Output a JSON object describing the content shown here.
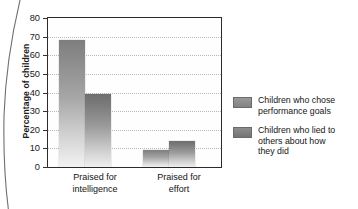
{
  "chart_data": {
    "type": "bar",
    "title": "",
    "xlabel": "",
    "ylabel": "Percentage of children",
    "ylim": [
      0,
      80
    ],
    "ytick_step": 10,
    "yticks": [
      80,
      70,
      60,
      50,
      40,
      30,
      20,
      10,
      0
    ],
    "grid": "horizontal-dotted",
    "legend_position": "right",
    "categories": [
      "Praised for intelligence",
      "Praised for effort"
    ],
    "category_lines": [
      [
        "Praised for",
        "intelligence"
      ],
      [
        "Praised for",
        "effort"
      ]
    ],
    "series": [
      {
        "name": "Children who chose performance goals",
        "name_lines": [
          "Children who chose",
          "performance goals"
        ],
        "color": "#8a8a8a",
        "values": [
          68,
          9
        ]
      },
      {
        "name": "Children who lied to others about how they did",
        "name_lines": [
          "Children who lied to",
          "others about how",
          "they did"
        ],
        "color": "#7a7a7a",
        "values": [
          39,
          14
        ]
      }
    ]
  },
  "colors": {
    "frame": "#2b2b2b",
    "gridline": "#b9b9b9",
    "text": "#141414",
    "bar_light": "#8a8a8a",
    "bar_dark": "#7a7a7a",
    "background": "#ffffff"
  }
}
